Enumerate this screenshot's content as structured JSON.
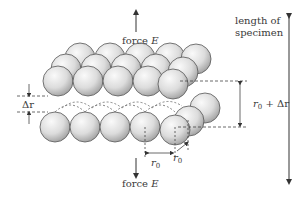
{
  "diagram": {
    "labels": {
      "force_top": "force ",
      "force_top_var": "E",
      "force_bottom": "force ",
      "force_bottom_var": "E",
      "length_line1": "length of",
      "length_line2": "specimen",
      "delta_r": "Δr",
      "r0_plus_prefix": "r",
      "r0_plus_sub": "0",
      "r0_plus_suffix": " + Δr",
      "r0_horizontal": "r",
      "r0_horizontal_sub": "0",
      "r0_diagonal": "r",
      "r0_diagonal_sub": "0"
    },
    "colors": {
      "sphere_light": "#f4f4f4",
      "sphere_dark": "#9a9a9a",
      "sphere_stroke": "#555555",
      "line": "#333333",
      "dash": "#555555",
      "text": "#3a3a3a"
    },
    "upper_layer": {
      "back_row": [
        {
          "cx": 80,
          "cy": 58
        },
        {
          "cx": 110,
          "cy": 58
        },
        {
          "cx": 140,
          "cy": 58
        },
        {
          "cx": 170,
          "cy": 58
        },
        {
          "cx": 196,
          "cy": 59
        }
      ],
      "mid_row": [
        {
          "cx": 66,
          "cy": 69
        },
        {
          "cx": 96,
          "cy": 69
        },
        {
          "cx": 126,
          "cy": 69
        },
        {
          "cx": 156,
          "cy": 69
        },
        {
          "cx": 183,
          "cy": 72
        }
      ],
      "front_row": [
        {
          "cx": 58,
          "cy": 81
        },
        {
          "cx": 88,
          "cy": 81
        },
        {
          "cx": 118,
          "cy": 81
        },
        {
          "cx": 148,
          "cy": 81
        },
        {
          "cx": 173,
          "cy": 84
        }
      ]
    },
    "lower_layer": {
      "back_row": [
        {
          "cx": 205,
          "cy": 108
        }
      ],
      "mid_row": [
        {
          "cx": 189,
          "cy": 121
        }
      ],
      "front_row": [
        {
          "cx": 55,
          "cy": 127
        },
        {
          "cx": 85,
          "cy": 127
        },
        {
          "cx": 115,
          "cy": 127
        },
        {
          "cx": 145,
          "cy": 127
        },
        {
          "cx": 175,
          "cy": 130
        }
      ]
    },
    "sphere_radius": 15
  }
}
